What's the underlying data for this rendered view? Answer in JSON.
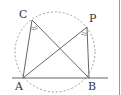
{
  "diagram": {
    "type": "geometry-inscribed-angles",
    "points": {
      "A": {
        "label": "A",
        "x": 23,
        "y": 78
      },
      "B": {
        "label": "B",
        "x": 89,
        "y": 78
      },
      "C": {
        "label": "C",
        "x": 32,
        "y": 20
      },
      "P": {
        "label": "P",
        "x": 87,
        "y": 27
      }
    },
    "circle": {
      "cx": 55,
      "cy": 52,
      "r": 40,
      "style": "dashed"
    },
    "segments": [
      "CA",
      "CB",
      "PA",
      "PB"
    ],
    "line": {
      "through": "AB",
      "style": "solid"
    },
    "angle_marks": [
      "ACB",
      "APB"
    ],
    "colors": {
      "stroke": "#555555",
      "dashed": "#888888",
      "border": "#999999"
    }
  }
}
